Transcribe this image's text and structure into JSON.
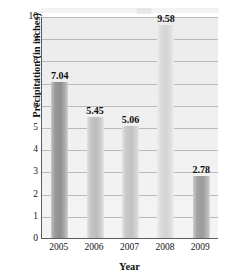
{
  "chart_data": {
    "type": "bar",
    "title": "",
    "xlabel": "Year",
    "ylabel": "Precipitation (in inches)",
    "categories": [
      "2005",
      "2006",
      "2007",
      "2008",
      "2009"
    ],
    "values": [
      7.04,
      5.45,
      5.06,
      9.58,
      2.78
    ],
    "value_labels": [
      "7.04",
      "5.45",
      "5.06",
      "9.58",
      "2.78"
    ],
    "ylim": [
      0,
      10
    ],
    "yticks": [
      0,
      1,
      2,
      3,
      4,
      5,
      6,
      7,
      8,
      9,
      10
    ],
    "ytick_labels": [
      "0",
      "1",
      "2",
      "3",
      "4",
      "5",
      "6",
      "7",
      "8",
      "9",
      "10"
    ],
    "grid": "horizontal",
    "legend": "none",
    "bar_colors": [
      "#8e8e8e",
      "#bcbcbc",
      "#c1c1c1",
      "#d3d3d3",
      "#999999"
    ],
    "plot_background": "#efefef",
    "axis_color": "#5d5d5d",
    "gridline_color": "#b9b9b9",
    "label_text_color": "#0d0d0d"
  }
}
